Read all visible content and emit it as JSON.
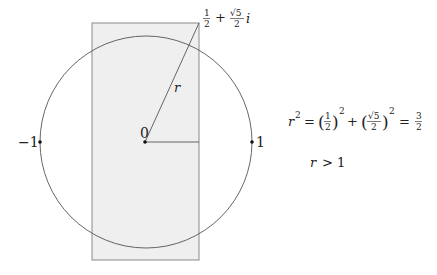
{
  "diagram": {
    "type": "complex-plane-figure",
    "colors": {
      "background": "#ffffff",
      "rect_fill": "#efefef",
      "rect_stroke": "#8a8a8a",
      "circle_stroke": "#555555",
      "line_stroke": "#555555",
      "point_fill": "#111111",
      "text": "#222222"
    },
    "rectangle": {
      "x": 92,
      "y": 23,
      "width": 107,
      "height": 237
    },
    "circle": {
      "cx": 146,
      "cy": 142,
      "r": 106
    },
    "origin": {
      "x": 145,
      "y": 142
    },
    "radius_line": {
      "x1": 145,
      "y1": 142,
      "x2": 199,
      "y2": 23
    },
    "horizontal_line": {
      "x1": 145,
      "y1": 142,
      "x2": 199,
      "y2": 142
    },
    "points": [
      {
        "label": "-1",
        "x": 40,
        "y": 142
      },
      {
        "label": "0",
        "x": 145,
        "y": 142
      },
      {
        "label": "1",
        "x": 252,
        "y": 142
      }
    ],
    "labels": {
      "minus_one": "−1",
      "zero": "0",
      "one": "1",
      "r": "r",
      "corner_point": {
        "half_num": "1",
        "half_den": "2",
        "plus": "+",
        "sqrt5": "√5",
        "sqrt5_den": "2",
        "i": "i"
      }
    },
    "equation": {
      "lhs": "r",
      "lhs_exp": "2",
      "eq1": "=",
      "t1_num": "1",
      "t1_den": "2",
      "t1_exp": "2",
      "plus": "+",
      "t2_num": "√5",
      "t2_den": "2",
      "t2_exp": "2",
      "eq2": "=",
      "res_num": "3",
      "res_den": "2",
      "paren_open": "(",
      "paren_close": ")"
    },
    "inequality": {
      "r": "r",
      "op": ">",
      "value": "1"
    }
  }
}
